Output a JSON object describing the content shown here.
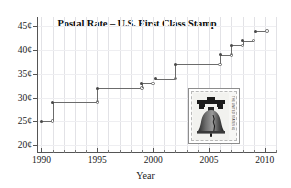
{
  "chart_data": {
    "type": "line",
    "title": "Postal Rate – U.S. First Class Stamp",
    "xlabel": "Year",
    "ylabel": "",
    "xlim": [
      1989.6,
      2011.0
    ],
    "ylim": [
      18.5,
      47.0
    ],
    "grid": true,
    "legend": null,
    "x_ticks": [
      "1990",
      "1995",
      "2000",
      "2005",
      "2010"
    ],
    "x_tick_values": [
      1990,
      1995,
      2000,
      2005,
      2010
    ],
    "y_ticks": [
      "20¢",
      "25¢",
      "30¢",
      "35¢",
      "40¢",
      "45¢"
    ],
    "y_tick_values": [
      20,
      25,
      30,
      35,
      40,
      45
    ],
    "series": [
      {
        "name": "First Class Stamp Rate",
        "style": "step-post",
        "marker_start": "filled-circle",
        "marker_end": "open-circle",
        "x": [
          1990,
          1991,
          1995,
          1999,
          2001,
          2002,
          2006,
          2007,
          2008,
          2009
        ],
        "values": [
          25,
          29,
          32,
          33,
          34,
          37,
          39,
          41,
          42,
          44
        ],
        "segments": [
          {
            "year_start": 1990.0,
            "year_end": 1991.0,
            "rate": 25
          },
          {
            "year_start": 1991.0,
            "year_end": 1995.0,
            "rate": 29
          },
          {
            "year_start": 1995.0,
            "year_end": 1999.0,
            "rate": 32
          },
          {
            "year_start": 1999.0,
            "year_end": 2000.0,
            "rate": 33
          },
          {
            "year_start": 2000.2,
            "year_end": 2002.0,
            "rate": 34
          },
          {
            "year_start": 2002.0,
            "year_end": 2006.0,
            "rate": 37
          },
          {
            "year_start": 2006.0,
            "year_end": 2007.0,
            "rate": 39
          },
          {
            "year_start": 2007.0,
            "year_end": 2008.0,
            "rate": 41
          },
          {
            "year_start": 2008.0,
            "year_end": 2009.0,
            "rate": 42
          },
          {
            "year_start": 2009.2,
            "year_end": 2010.2,
            "rate": 44
          }
        ]
      }
    ]
  },
  "inset": {
    "name": "liberty-bell-stamp",
    "caption": "",
    "side_text": "THE UNITED STATES 41"
  },
  "colors": {
    "line": "#6b6b6b",
    "marker_filled": "#4a4a4a",
    "axis": "#555555",
    "grid": "#e2e2e6",
    "text": "#1a1a1a",
    "background": "#ffffff"
  }
}
